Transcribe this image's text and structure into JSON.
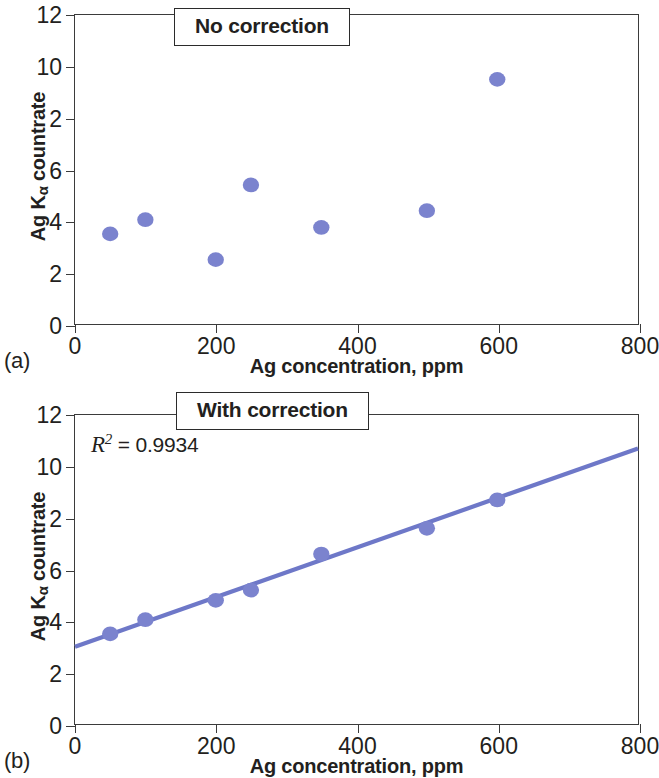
{
  "figure": {
    "marker_color": "#7b83ce",
    "line_color": "#6e78c8",
    "axis_color": "#3b3b3b",
    "background": "#ffffff"
  },
  "panels": [
    {
      "letter": "(a)",
      "caption": "No correction",
      "xlabel": "Ag concentration, ppm",
      "ylabel_main": "Ag K",
      "ylabel_sub": "α",
      "ylabel_tail": " countrate",
      "xticks": [
        "0",
        "200",
        "400",
        "600",
        "800"
      ],
      "yticks": [
        "12",
        "10",
        "2",
        "6",
        "4",
        "2",
        "0"
      ]
    },
    {
      "letter": "(b)",
      "caption": "With correction",
      "xlabel": "Ag concentration, ppm",
      "ylabel_main": "Ag K",
      "ylabel_sub": "α",
      "ylabel_tail": " countrate",
      "xticks": [
        "0",
        "200",
        "400",
        "600",
        "800"
      ],
      "yticks": [
        "12",
        "10",
        "2",
        "6",
        "4",
        "2",
        "0"
      ],
      "r2_symbol": "R",
      "r2_superscript": "2",
      "r2_text": " = 0.9934"
    }
  ],
  "chart_data": [
    {
      "type": "scatter",
      "title": "No correction",
      "panel": "(a)",
      "xlabel": "Ag concentration, ppm",
      "ylabel": "Ag Kα countrate",
      "xlim": [
        0,
        800
      ],
      "ylim": [
        0,
        12
      ],
      "xticks": [
        0,
        200,
        400,
        600,
        800
      ],
      "yticks": [
        0,
        2,
        4,
        6,
        8,
        10,
        12
      ],
      "ytick_labels": [
        "0",
        "2",
        "4",
        "6",
        "2",
        "10",
        "12"
      ],
      "grid": false,
      "legend": "none",
      "series": [
        {
          "name": "Ag Kα countrate (uncorrected)",
          "x": [
            50,
            100,
            200,
            250,
            350,
            500,
            600
          ],
          "y": [
            3.5,
            4.05,
            2.5,
            5.4,
            3.75,
            4.4,
            9.5
          ]
        }
      ]
    },
    {
      "type": "scatter",
      "title": "With correction",
      "panel": "(b)",
      "xlabel": "Ag concentration, ppm",
      "ylabel": "Ag Kα countrate",
      "xlim": [
        0,
        800
      ],
      "ylim": [
        0,
        12
      ],
      "xticks": [
        0,
        200,
        400,
        600,
        800
      ],
      "yticks": [
        0,
        2,
        4,
        6,
        8,
        10,
        12
      ],
      "ytick_labels": [
        "0",
        "2",
        "4",
        "6",
        "2",
        "10",
        "12"
      ],
      "grid": false,
      "legend": "none",
      "annotation": "R2 = 0.9934",
      "r_squared": 0.9934,
      "series": [
        {
          "name": "Ag Kα countrate (corrected)",
          "x": [
            50,
            100,
            200,
            250,
            350,
            500,
            600
          ],
          "y": [
            3.5,
            4.05,
            4.8,
            5.2,
            6.6,
            7.6,
            8.7
          ]
        }
      ],
      "fit_line": {
        "x": [
          0,
          800
        ],
        "y": [
          3.0,
          10.7
        ]
      }
    }
  ]
}
